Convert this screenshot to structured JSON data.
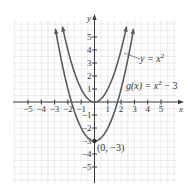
{
  "chart_data": {
    "type": "line",
    "title": "",
    "xlabel": "x",
    "ylabel": "y",
    "xlim": [
      -6,
      6
    ],
    "ylim": [
      -6,
      6
    ],
    "grid": true,
    "x_ticks": [
      -5,
      -4,
      -3,
      -2,
      -1,
      1,
      2,
      3,
      4,
      5
    ],
    "y_ticks": [
      -5,
      -4,
      -3,
      -2,
      -1,
      1,
      2,
      3,
      4,
      5
    ],
    "x_tick_labels": [
      "−5",
      "−4",
      "−3",
      "−2",
      "−1",
      "1",
      "2",
      "3",
      "4",
      "5"
    ],
    "y_tick_labels": [
      "−5",
      "−4",
      "−3",
      "−2",
      "−1",
      "1",
      "2",
      "3",
      "4",
      "5"
    ],
    "series": [
      {
        "name": "y = x²",
        "function": "x^2",
        "x_range": [
          -2.4,
          2.4
        ],
        "x": [
          -2.4,
          -2,
          -1,
          0,
          1,
          2,
          2.4
        ],
        "values": [
          5.76,
          4,
          1,
          0,
          1,
          4,
          5.76
        ]
      },
      {
        "name": "g(x) = x² − 3",
        "function": "x^2 - 3",
        "x_range": [
          -2.93,
          2.93
        ],
        "x": [
          -2.93,
          -2,
          -1,
          0,
          1,
          2,
          2.93
        ],
        "values": [
          5.58,
          1,
          -2,
          -3,
          -2,
          1,
          5.58
        ]
      }
    ],
    "annotations": [
      {
        "text": "y = x²",
        "points_to": "y = x²"
      },
      {
        "text": "g(x) = x² − 3",
        "points_to": "g(x) = x² − 3"
      },
      {
        "text": "(0, −3)",
        "point": [
          0,
          -3
        ]
      }
    ]
  },
  "labels": {
    "x_axis": "x",
    "y_axis": "y",
    "curve1": "y = x",
    "curve1_exp": "2",
    "curve2_a": "g(x) = x",
    "curve2_exp": "2",
    "curve2_b": " − 3",
    "point": "(0, −3)"
  },
  "colors": {
    "curve": "#5a5a66",
    "axis": "#3a3a3a",
    "grid": "#e6e6e6"
  }
}
